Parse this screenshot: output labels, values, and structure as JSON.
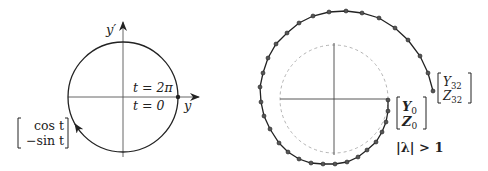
{
  "left_diagram": {
    "axis_y_label": "y′",
    "axis_x_label": "y",
    "label_t_top": "t = 2π",
    "label_t_bottom": "t = 0",
    "vector_top": "cos t",
    "vector_bottom": "−sin t",
    "circle": {
      "cx": 123,
      "cy": 97,
      "r": 55
    },
    "start_point": {
      "x": 178,
      "y": 97
    }
  },
  "right_diagram": {
    "start_vector_top": "Y",
    "start_vector_top_sub": "0",
    "start_vector_bottom": "Z",
    "start_vector_bottom_sub": "0",
    "end_vector_top": "Y",
    "end_vector_top_sub": "32",
    "end_vector_bottom": "Z",
    "end_vector_bottom_sub": "32",
    "condition_label": "|λ| > 1",
    "unit_circle": {
      "cx": 334,
      "cy": 99,
      "r": 54
    },
    "spiral_points": [
      [
        388,
        100
      ],
      [
        388,
        111
      ],
      [
        386,
        122
      ],
      [
        382,
        132
      ],
      [
        376,
        142
      ],
      [
        367,
        150
      ],
      [
        358,
        157
      ],
      [
        347,
        162
      ],
      [
        335,
        164
      ],
      [
        323,
        164
      ],
      [
        311,
        163
      ],
      [
        299,
        159
      ],
      [
        288,
        152
      ],
      [
        279,
        143
      ],
      [
        270,
        129
      ],
      [
        264,
        116
      ],
      [
        261,
        102
      ],
      [
        260,
        87
      ],
      [
        263,
        73
      ],
      [
        268,
        58
      ],
      [
        276,
        44
      ],
      [
        287,
        33
      ],
      [
        299,
        23
      ],
      [
        313,
        16
      ],
      [
        329,
        12
      ],
      [
        346,
        11
      ],
      [
        362,
        13
      ],
      [
        379,
        18
      ],
      [
        395,
        28
      ],
      [
        408,
        40
      ],
      [
        420,
        56
      ],
      [
        428,
        73
      ],
      [
        433,
        91
      ]
    ]
  },
  "colors": {
    "stroke": "#222222",
    "axis": "#444444",
    "dashed_circle": "#aaaaaa",
    "point_fill": "#555555"
  }
}
